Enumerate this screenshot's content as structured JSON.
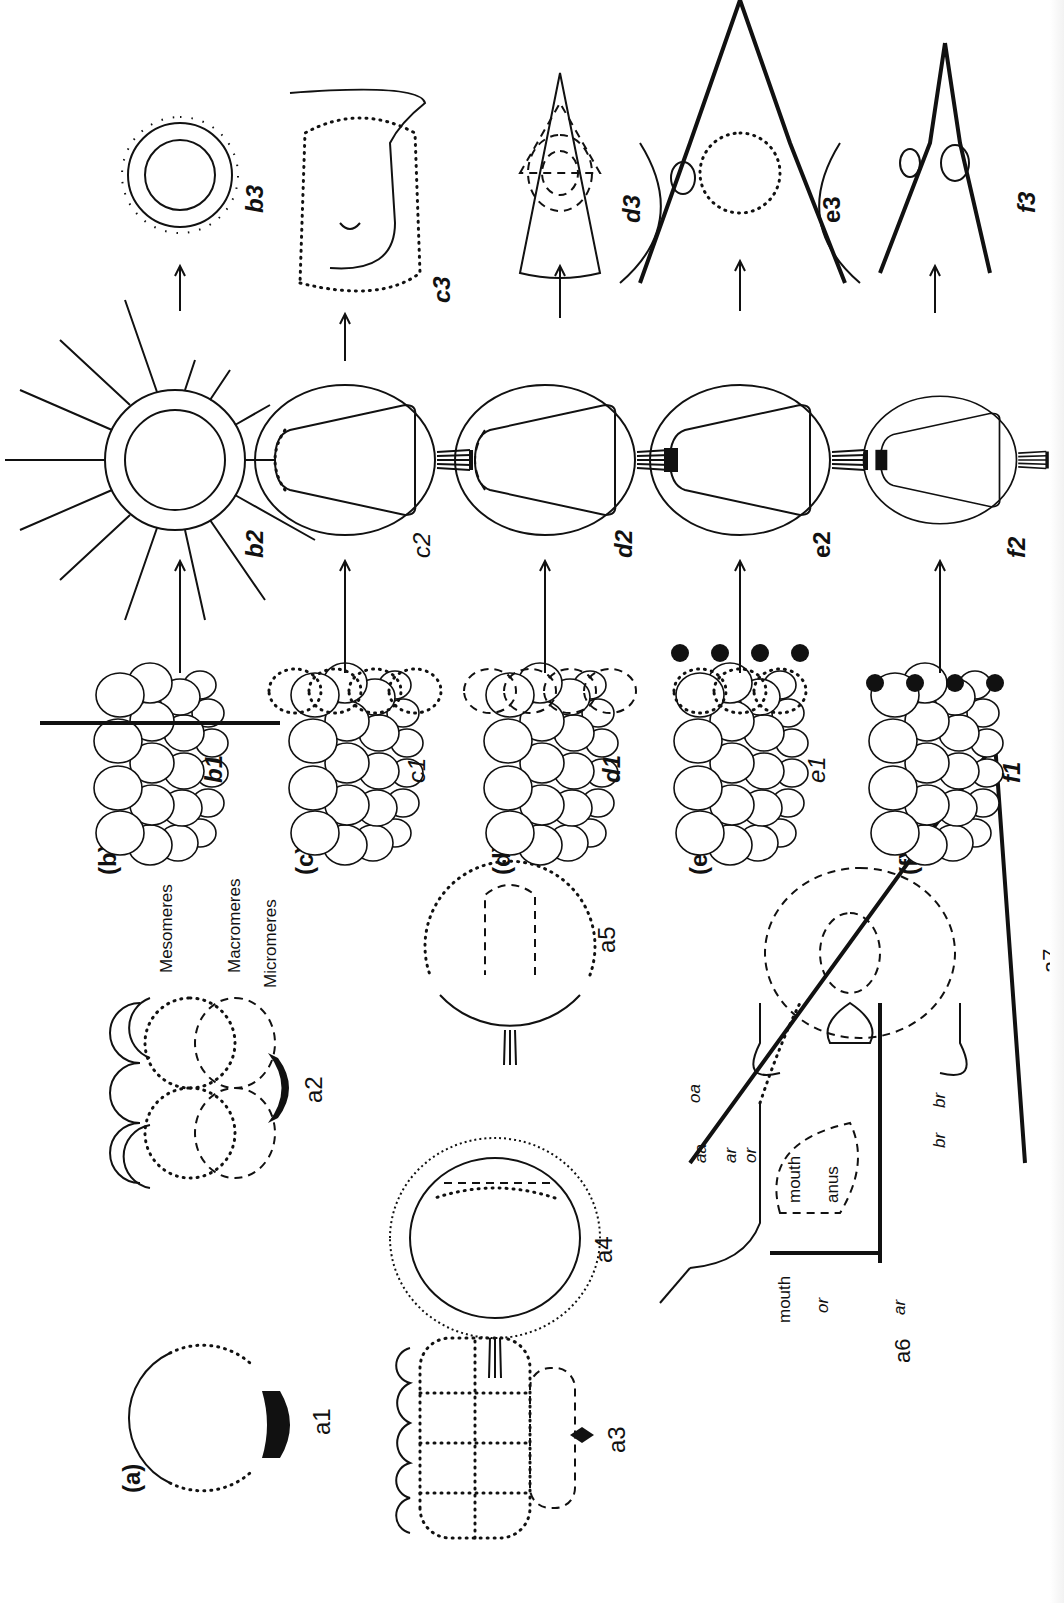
{
  "figure": {
    "panel_labels": [
      "(a)",
      "(b)",
      "(c)",
      "(d)",
      "(e)",
      "(f)"
    ],
    "panel_a": {
      "stages": [
        "a1",
        "a2",
        "a3",
        "a4",
        "a5",
        "a6",
        "a7"
      ],
      "a2_labels": [
        "Mesomeres",
        "Macromeres",
        "Micromeres"
      ],
      "a6_labels": [
        "mouth",
        "or",
        "ar",
        "br"
      ],
      "a7_labels": [
        "oa",
        "aa",
        "ar",
        "or",
        "mouth",
        "anus",
        "br"
      ]
    },
    "rows": [
      {
        "label": "(b)",
        "stages": [
          "b1",
          "b2",
          "b3"
        ]
      },
      {
        "label": "(c)",
        "stages": [
          "c1",
          "c2",
          "c3"
        ]
      },
      {
        "label": "(d)",
        "stages": [
          "d1",
          "d2",
          "d3"
        ]
      },
      {
        "label": "(e)",
        "stages": [
          "e1",
          "e2",
          "e3"
        ]
      },
      {
        "label": "(f)",
        "stages": [
          "f1",
          "f2",
          "f3"
        ]
      }
    ],
    "orientation": "rotated 90° counter-clockwise"
  }
}
